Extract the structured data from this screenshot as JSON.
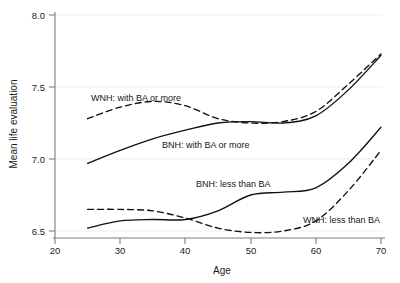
{
  "chart_data": {
    "type": "line",
    "title": "",
    "xlabel": "Age",
    "ylabel": "Mean life evaluation",
    "xlim": [
      20,
      70
    ],
    "ylim": [
      6.5,
      8.0
    ],
    "xticks": [
      20,
      30,
      40,
      50,
      60,
      70
    ],
    "yticks": [
      "6.5",
      "7.0",
      "7.5",
      "8.0"
    ],
    "grid": true,
    "legend": "inline-labels",
    "x": [
      25,
      30,
      35,
      40,
      45,
      50,
      55,
      60,
      65,
      70
    ],
    "series": [
      {
        "name": "WNH: with BA or more",
        "style": "dashed",
        "label_x": 37,
        "label_y": 7.61,
        "values": [
          7.28,
          7.36,
          7.4,
          7.37,
          7.28,
          7.25,
          7.26,
          7.33,
          7.52,
          7.73
        ]
      },
      {
        "name": "BNH: with BA or more",
        "style": "solid",
        "label_x": 45,
        "label_y": 7.2,
        "values": [
          6.97,
          7.06,
          7.14,
          7.2,
          7.25,
          7.26,
          7.25,
          7.3,
          7.48,
          7.72
        ]
      },
      {
        "name": "BNH: less than BA",
        "style": "solid",
        "label_x": 45,
        "label_y": 6.88,
        "values": [
          6.52,
          6.57,
          6.58,
          6.58,
          6.64,
          6.75,
          6.77,
          6.8,
          6.97,
          7.22
        ]
      },
      {
        "name": "WNH: less than BA",
        "style": "dashed",
        "label_x": 63,
        "label_y": 6.63,
        "values": [
          6.65,
          6.65,
          6.64,
          6.59,
          6.52,
          6.49,
          6.5,
          6.57,
          6.78,
          7.06
        ]
      }
    ]
  },
  "axis": {
    "y_title": "Mean life evaluation",
    "x_title": "Age",
    "y_tick_0": "6.5",
    "y_tick_1": "7.0",
    "y_tick_2": "7.5",
    "y_tick_3": "8.0",
    "x_tick_0": "20",
    "x_tick_1": "30",
    "x_tick_2": "40",
    "x_tick_3": "50",
    "x_tick_4": "60",
    "x_tick_5": "70"
  },
  "labels": {
    "wnh_ba": "WNH: with BA or more",
    "bnh_ba": "BNH: with BA or more",
    "bnh_less": "BNH: less than BA",
    "wnh_less": "WNH: less than BA"
  },
  "colors": {
    "curve": "#111111",
    "axis": "#7d7d7d",
    "grid": "#e8e8e8",
    "text": "#1a1a1a",
    "background": "#ffffff"
  }
}
